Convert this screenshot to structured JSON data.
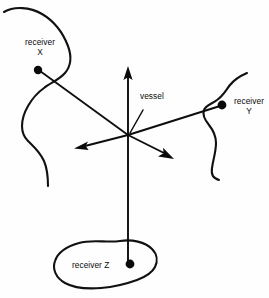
{
  "diagram": {
    "background_color": "#fefefe",
    "ink_color": "#0a0a0a",
    "labels": {
      "vessel": "vessel",
      "receiver_x_line1": "receiver",
      "receiver_x_line2": "X",
      "receiver_y_line1": "receiver",
      "receiver_y_line2": "Y",
      "receiver_z": "receiver Z"
    },
    "nodes": [
      {
        "name": "vessel",
        "x": 128,
        "y": 135,
        "marker": "none"
      },
      {
        "name": "receiver-x",
        "x": 38,
        "y": 70,
        "marker": "dot"
      },
      {
        "name": "receiver-y",
        "x": 222,
        "y": 105,
        "marker": "dot"
      },
      {
        "name": "receiver-z",
        "x": 128,
        "y": 265,
        "marker": "dot"
      }
    ],
    "rays": [
      {
        "name": "ray-to-receiver-x",
        "from": "vessel",
        "to": "receiver-x",
        "arrow": false
      },
      {
        "name": "ray-to-receiver-y",
        "from": "vessel",
        "to": "receiver-y",
        "arrow": false
      },
      {
        "name": "ray-to-receiver-z",
        "from": "vessel",
        "to": "receiver-z",
        "arrow": false
      },
      {
        "name": "ray-up",
        "from": "vessel",
        "to_x": 128,
        "to_y": 68,
        "arrow": true
      },
      {
        "name": "ray-left",
        "from": "vessel",
        "to_x": 76,
        "to_y": 147,
        "arrow": true
      },
      {
        "name": "ray-down-right",
        "from": "vessel",
        "to_x": 172,
        "to_y": 160,
        "arrow": true
      }
    ],
    "shapes": [
      {
        "name": "coastline-top-left",
        "type": "open-curve"
      },
      {
        "name": "coastline-right",
        "type": "open-curve"
      },
      {
        "name": "island-bottom",
        "type": "closed-curve"
      }
    ]
  }
}
